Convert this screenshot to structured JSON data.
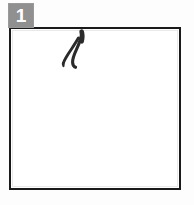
{
  "panel": {
    "badge_number": "1",
    "badge_color": "#909090",
    "badge_text_color": "#ffffff",
    "frame_border_color": "#1a1a1a",
    "frame_fill_color": "#ffffff",
    "page_background": "#fdfdfd"
  },
  "artwork": {
    "name": "ink-stroke-mark",
    "description": "hand-drawn ink stroke mark",
    "ink_color": "#2b2b2b",
    "stroke_count": "2",
    "strokes": [
      {
        "name": "outer-stroke",
        "label": "long tapered curve"
      },
      {
        "name": "inner-stroke",
        "label": "short hooked curve"
      }
    ]
  }
}
